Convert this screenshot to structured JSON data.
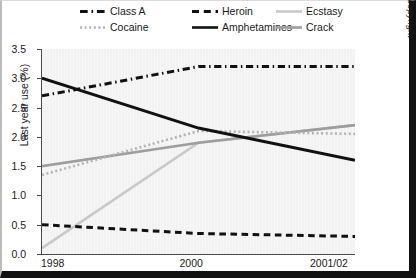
{
  "chart_data": {
    "type": "line",
    "title": "",
    "xlabel": "",
    "ylabel": "Last year use (%)",
    "x": [
      "1998",
      "2000",
      "2001/02"
    ],
    "xlim": [
      0,
      2
    ],
    "ylim": [
      0.0,
      3.5
    ],
    "yticks": [
      "0.0",
      "0.5",
      "1.0",
      "1.5",
      "2.0",
      "2.5",
      "3.0",
      "3.5"
    ],
    "ytick_values": [
      0.0,
      0.5,
      1.0,
      1.5,
      2.0,
      2.5,
      3.0,
      3.5
    ],
    "grid": "vertical-faint",
    "legend_position": "top",
    "series": [
      {
        "name": "Class A",
        "values": [
          2.7,
          3.2,
          3.2
        ],
        "style": "dash-dot",
        "color": "#111111",
        "width": 3.0
      },
      {
        "name": "Heroin",
        "values": [
          0.5,
          0.35,
          0.3
        ],
        "style": "dashed",
        "color": "#111111",
        "width": 3.0
      },
      {
        "name": "Ecstasy",
        "values": [
          0.1,
          1.9,
          2.2
        ],
        "style": "solid",
        "color": "#c9c9c9",
        "width": 2.6
      },
      {
        "name": "Cocaine",
        "values": [
          1.35,
          2.1,
          2.05
        ],
        "style": "dotted",
        "color": "#b4b4b4",
        "width": 2.6
      },
      {
        "name": "Amphetamines",
        "values": [
          3.0,
          2.15,
          1.6
        ],
        "style": "solid",
        "color": "#111111",
        "width": 3.0
      },
      {
        "name": "Crack",
        "values": [
          1.5,
          1.9,
          2.2
        ],
        "style": "solid",
        "color": "#9e9e9e",
        "width": 2.6
      }
    ],
    "annotations": {
      "source": "Source: British Crime Survey, Crown copyright"
    }
  },
  "legend": {
    "items": [
      {
        "label": "Class A",
        "style": "dash-dot",
        "color": "#111111",
        "row": 0,
        "col": 0
      },
      {
        "label": "Heroin",
        "style": "dashed",
        "color": "#111111",
        "row": 0,
        "col": 1
      },
      {
        "label": "Ecstasy",
        "style": "solid",
        "color": "#c9c9c9",
        "row": 0,
        "col": 2
      },
      {
        "label": "Cocaine",
        "style": "dotted",
        "color": "#b4b4b4",
        "row": 1,
        "col": 0
      },
      {
        "label": "Amphetamines",
        "style": "solid",
        "color": "#111111",
        "row": 1,
        "col": 1
      },
      {
        "label": "Crack",
        "style": "solid",
        "color": "#9e9e9e",
        "row": 1,
        "col": 2
      }
    ]
  },
  "axes": {
    "ylabel": "Last year use (%)",
    "ytick_labels": [
      "3.5",
      "3.0",
      "2.5",
      "2.0",
      "1.5",
      "1.0",
      "0.5",
      "0.0"
    ],
    "xtick_labels": [
      "1998",
      "2000",
      "2001/02"
    ]
  },
  "source_note": "Source: British Crime Survey, Crown copyright"
}
